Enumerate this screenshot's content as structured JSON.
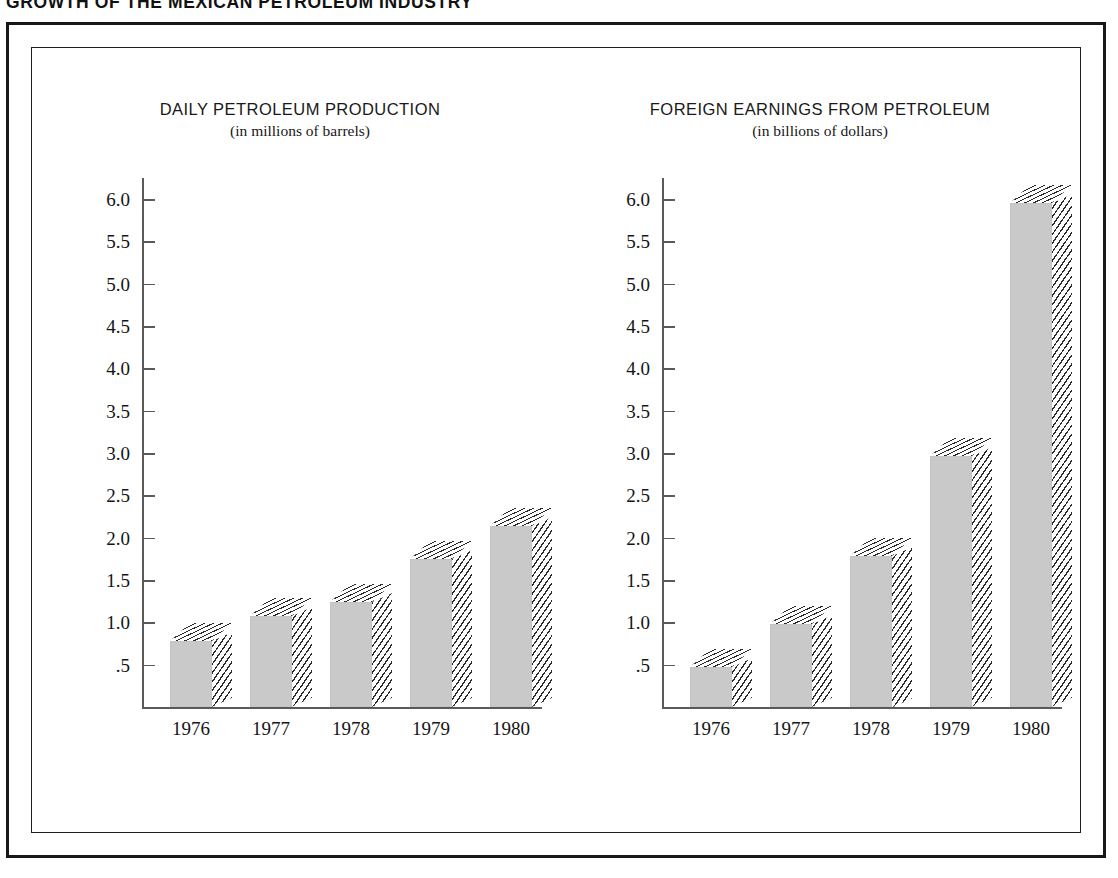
{
  "page": {
    "title": "GROWTH OF THE MEXICAN PETROLEUM INDUSTRY"
  },
  "frame": {
    "outer_color": "#16181a",
    "inner_color": "#1d1f21"
  },
  "style": {
    "bar_face_color": "#c9c9c9",
    "bar_hatch_color": "#2b2b2b",
    "axis_color": "#5a5a5a",
    "text_color": "#141414",
    "background": "#ffffff"
  },
  "chart_data": [
    {
      "id": "daily-petroleum-production",
      "type": "bar",
      "title": "DAILY PETROLEUM PRODUCTION",
      "subtitle": "(in millions of barrels)",
      "xlabel": "",
      "ylabel": "",
      "categories": [
        "1976",
        "1977",
        "1978",
        "1979",
        "1980"
      ],
      "values": [
        0.78,
        1.07,
        1.24,
        1.75,
        2.14
      ],
      "ylim": [
        0,
        6.25
      ],
      "yticks": [
        6.0,
        5.5,
        5.0,
        4.5,
        4.0,
        3.5,
        3.0,
        2.5,
        2.0,
        1.5,
        1.0,
        0.5
      ],
      "ytick_labels": [
        "6.0",
        "5.5",
        "5.0",
        "4.5",
        "4.0",
        "3.5",
        "3.0",
        "2.5",
        "2.0",
        "1.5",
        "1.0",
        ".5"
      ],
      "grid": false,
      "legend": "none"
    },
    {
      "id": "foreign-earnings-from-petroleum",
      "type": "bar",
      "title": "FOREIGN EARNINGS FROM PETROLEUM",
      "subtitle": "(in billions of dollars)",
      "xlabel": "",
      "ylabel": "",
      "categories": [
        "1976",
        "1977",
        "1978",
        "1979",
        "1980"
      ],
      "values": [
        0.47,
        0.98,
        1.79,
        2.96,
        5.95
      ],
      "ylim": [
        0,
        6.25
      ],
      "yticks": [
        6.0,
        5.5,
        5.0,
        4.5,
        4.0,
        3.5,
        3.0,
        2.5,
        2.0,
        1.5,
        1.0,
        0.5
      ],
      "ytick_labels": [
        "6.0",
        "5.5",
        "5.0",
        "4.5",
        "4.0",
        "3.5",
        "3.0",
        "2.5",
        "2.0",
        "1.5",
        "1.0",
        ".5"
      ],
      "grid": false,
      "legend": "none"
    }
  ]
}
